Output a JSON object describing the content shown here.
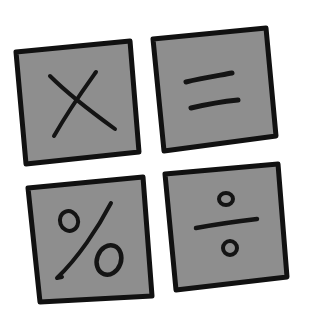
{
  "illustration": {
    "description": "Hand-drawn calculator operator keys",
    "background": "#ffffff",
    "tile_fill": "#8e8e8e",
    "tile_border": "#111111",
    "tiles": [
      {
        "symbol": "×",
        "name": "multiply",
        "position": "top-left"
      },
      {
        "symbol": "=",
        "name": "equals",
        "position": "top-right"
      },
      {
        "symbol": "%",
        "name": "percent",
        "position": "bottom-left"
      },
      {
        "symbol": "÷",
        "name": "divide",
        "position": "bottom-right"
      }
    ]
  }
}
